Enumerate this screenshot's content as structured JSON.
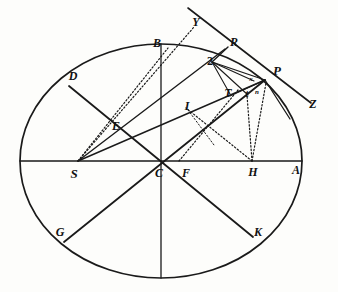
{
  "figure": {
    "background_color": "#fdfdfb",
    "ink_color": "#1a1a1a",
    "width": 338,
    "height": 292
  },
  "ellipse": {
    "center_x": 161,
    "center_y": 161,
    "semi_major": 141,
    "semi_minor": 117,
    "stroke_width": 1.7
  },
  "points": {
    "A": {
      "x": 302,
      "y": 161
    },
    "B": {
      "x": 161,
      "y": 44
    },
    "C": {
      "x": 161,
      "y": 161
    },
    "D": {
      "x": 69,
      "y": 86
    },
    "E": {
      "x": 121,
      "y": 128
    },
    "F": {
      "x": 181,
      "y": 161
    },
    "G": {
      "x": 64,
      "y": 242
    },
    "H": {
      "x": 252,
      "y": 161
    },
    "I": {
      "x": 195,
      "y": 110
    },
    "K": {
      "x": 253,
      "y": 237
    },
    "P": {
      "x": 265,
      "y": 80
    },
    "R": {
      "x": 225,
      "y": 49
    },
    "S": {
      "x": 78,
      "y": 161
    },
    "T": {
      "x": 232,
      "y": 96
    },
    "Y": {
      "x": 194,
      "y": 29
    },
    "Z": {
      "x": 311,
      "y": 103
    },
    "Q": {
      "x": 212,
      "y": 62
    },
    "t": {
      "x": 248,
      "y": 95
    },
    "x": {
      "x": 252,
      "y": 81
    },
    "n": {
      "x": 257,
      "y": 92
    }
  },
  "labels": [
    {
      "text": "Y",
      "x": 196,
      "y": 22,
      "size": "sz-md",
      "style": "italic",
      "name": "label-Y"
    },
    {
      "text": "B",
      "x": 157,
      "y": 43,
      "size": "sz-md",
      "style": "italic",
      "name": "label-B"
    },
    {
      "text": "R",
      "x": 234,
      "y": 42,
      "size": "sz-md",
      "style": "italic",
      "name": "label-R"
    },
    {
      "text": "P",
      "x": 277,
      "y": 70,
      "size": "sz-lg",
      "style": "italic",
      "name": "label-P"
    },
    {
      "text": "2",
      "x": 210,
      "y": 61,
      "size": "sz-md",
      "style": "upright",
      "name": "label-Q"
    },
    {
      "text": "D",
      "x": 73,
      "y": 76,
      "size": "sz-md",
      "style": "italic",
      "name": "label-D"
    },
    {
      "text": "Z",
      "x": 313,
      "y": 104,
      "size": "sz-md",
      "style": "italic",
      "name": "label-Z"
    },
    {
      "text": "T",
      "x": 228,
      "y": 93,
      "size": "sz-md",
      "style": "italic",
      "name": "label-T"
    },
    {
      "text": "I",
      "x": 187,
      "y": 106,
      "size": "sz-md",
      "style": "italic",
      "name": "label-I"
    },
    {
      "text": "E",
      "x": 116,
      "y": 126,
      "size": "sz-md",
      "style": "italic",
      "name": "label-E"
    },
    {
      "text": "x",
      "x": 251,
      "y": 79,
      "size": "sz-xs",
      "style": "italic",
      "name": "label-x"
    },
    {
      "text": "t",
      "x": 247,
      "y": 94,
      "size": "sz-sm",
      "style": "italic",
      "name": "label-t"
    },
    {
      "text": "n",
      "x": 257,
      "y": 92,
      "size": "sz-xs",
      "style": "italic",
      "name": "label-n"
    },
    {
      "text": "S",
      "x": 74,
      "y": 173,
      "size": "sz-lg",
      "style": "italic",
      "name": "label-S"
    },
    {
      "text": "C",
      "x": 159,
      "y": 173,
      "size": "sz-md",
      "style": "italic",
      "name": "label-C"
    },
    {
      "text": "F",
      "x": 186,
      "y": 173,
      "size": "sz-md",
      "style": "italic",
      "name": "label-F"
    },
    {
      "text": "H",
      "x": 253,
      "y": 172,
      "size": "sz-md",
      "style": "italic",
      "name": "label-H"
    },
    {
      "text": "A",
      "x": 296,
      "y": 170,
      "size": "sz-md",
      "style": "italic",
      "name": "label-A"
    },
    {
      "text": "G",
      "x": 60,
      "y": 232,
      "size": "sz-md",
      "style": "italic",
      "name": "label-G"
    },
    {
      "text": "K",
      "x": 258,
      "y": 232,
      "size": "sz-md",
      "style": "italic",
      "name": "label-K"
    }
  ],
  "solid_lines": [
    {
      "name": "major-axis",
      "x1": 20,
      "y1": 161,
      "x2": 302,
      "y2": 161,
      "w": 1.3
    },
    {
      "name": "minor-axis",
      "x1": 161,
      "y1": 44,
      "x2": 161,
      "y2": 278,
      "w": 1.3
    },
    {
      "name": "diameter-DK",
      "x1": 69,
      "y1": 86,
      "x2": 253,
      "y2": 237,
      "w": 1.8
    },
    {
      "name": "diameter-GP",
      "x1": 64,
      "y1": 242,
      "x2": 265,
      "y2": 80,
      "w": 1.8
    },
    {
      "name": "chord-S-to-P",
      "x1": 78,
      "y1": 161,
      "x2": 265,
      "y2": 80,
      "w": 1.4
    },
    {
      "name": "chord-S-to-R",
      "x1": 78,
      "y1": 161,
      "x2": 225,
      "y2": 49,
      "w": 1.4
    },
    {
      "name": "tangent-YRPZ",
      "x1": 188,
      "y1": 8,
      "x2": 311,
      "y2": 103,
      "w": 1.6
    },
    {
      "name": "segment-Q-to-R",
      "x1": 212,
      "y1": 62,
      "x2": 228,
      "y2": 47,
      "w": 1.4
    },
    {
      "name": "segment-Q-to-P",
      "x1": 212,
      "y1": 62,
      "x2": 265,
      "y2": 80,
      "w": 1.3
    },
    {
      "name": "segment-Q-to-x",
      "x1": 212,
      "y1": 62,
      "x2": 254,
      "y2": 81,
      "w": 1.1
    },
    {
      "name": "segment-Q-to-t",
      "x1": 212,
      "y1": 62,
      "x2": 248,
      "y2": 95,
      "w": 1.1
    },
    {
      "name": "segment-Q-to-T",
      "x1": 212,
      "y1": 62,
      "x2": 230,
      "y2": 94,
      "w": 1.1
    },
    {
      "name": "segment-T-to-P",
      "x1": 230,
      "y1": 96,
      "x2": 265,
      "y2": 80,
      "w": 1.1
    },
    {
      "name": "segment-P-arc-tail",
      "x1": 265,
      "y1": 80,
      "x2": 290,
      "y2": 119,
      "w": 1.3
    }
  ],
  "dotted_lines": [
    {
      "name": "dotted-S-to-Y",
      "x1": 78,
      "y1": 161,
      "x2": 194,
      "y2": 27,
      "w": 1.2
    },
    {
      "name": "dotted-S-to-B",
      "x1": 78,
      "y1": 161,
      "x2": 168,
      "y2": 48,
      "w": 1.2
    },
    {
      "name": "dotted-H-to-t",
      "x1": 252,
      "y1": 161,
      "x2": 247,
      "y2": 95,
      "w": 1.2
    },
    {
      "name": "dotted-H-to-P",
      "x1": 252,
      "y1": 161,
      "x2": 266,
      "y2": 83,
      "w": 1.2
    },
    {
      "name": "dotted-H-to-I",
      "x1": 252,
      "y1": 161,
      "x2": 186,
      "y2": 108,
      "w": 1.2
    },
    {
      "name": "dotted-F-to-T",
      "x1": 179,
      "y1": 161,
      "x2": 238,
      "y2": 90,
      "w": 1.2
    },
    {
      "name": "dotted-I-to-F",
      "x1": 188,
      "y1": 110,
      "x2": 214,
      "y2": 145,
      "w": 1.0
    }
  ]
}
